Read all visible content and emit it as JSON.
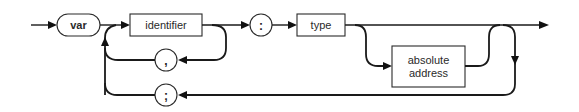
{
  "diagram": {
    "kind": "syntax-diagram",
    "nodes": {
      "var": {
        "label": "var",
        "shape": "rounded-terminal"
      },
      "identifier": {
        "label": "identifier",
        "shape": "rectangle"
      },
      "comma": {
        "label": ",",
        "shape": "circle"
      },
      "colon": {
        "label": ":",
        "shape": "circle"
      },
      "type": {
        "label": "type",
        "shape": "rectangle"
      },
      "absolute_address": {
        "label_line1": "absolute",
        "label_line2": "address",
        "shape": "rectangle"
      },
      "semicolon": {
        "label": ";",
        "shape": "circle"
      }
    },
    "edges": [
      {
        "from": "entry",
        "to": "var"
      },
      {
        "from": "var",
        "to": "identifier"
      },
      {
        "from": "identifier",
        "to": "comma",
        "note": "loop back"
      },
      {
        "from": "comma",
        "to": "identifier"
      },
      {
        "from": "identifier",
        "to": "colon"
      },
      {
        "from": "colon",
        "to": "type"
      },
      {
        "from": "type",
        "to": "exit"
      },
      {
        "from": "type",
        "to": "absolute_address",
        "note": "optional branch"
      },
      {
        "from": "absolute_address",
        "to": "exit"
      },
      {
        "from": "exit",
        "to": "semicolon",
        "note": "repeat loop"
      },
      {
        "from": "semicolon",
        "to": "identifier"
      }
    ],
    "colors": {
      "line": "#1a1a1a",
      "background": "#ffffff"
    }
  }
}
